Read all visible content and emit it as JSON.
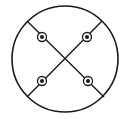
{
  "diagram": {
    "width": 131,
    "height": 119,
    "stroke_color": "#1a1a1a",
    "background": "#ffffff",
    "outer_circle": {
      "cx": 65,
      "cy": 59,
      "r": 53
    },
    "lines": [
      {
        "x1": 27,
        "y1": 21,
        "x2": 104,
        "y2": 97
      },
      {
        "x1": 102,
        "y1": 21,
        "x2": 27,
        "y2": 97
      }
    ],
    "markers": [
      {
        "name": "top-left",
        "cx": 42,
        "cy": 37
      },
      {
        "name": "top-right",
        "cx": 87,
        "cy": 37
      },
      {
        "name": "bottom-left",
        "cx": 42,
        "cy": 81
      },
      {
        "name": "bottom-right",
        "cx": 88,
        "cy": 81
      }
    ],
    "marker_outer_r": 4.5,
    "marker_inner_r": 2
  }
}
